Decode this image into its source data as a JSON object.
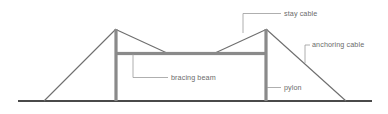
{
  "diagram": {
    "colors": {
      "ground": "#4a4a4a",
      "structure": "#8a8a8a",
      "cable": "#6e6e6e",
      "leader": "#9a9a9a",
      "label_text": "#6b6b6b",
      "background": "#ffffff"
    },
    "ground": {
      "name": "ground-line",
      "x1": 18,
      "y1": 101,
      "x2": 372,
      "y2": 101
    },
    "pylons": [
      {
        "name": "pylon-left",
        "x": 116,
        "top": 29,
        "bottom": 101,
        "width": 3.2
      },
      {
        "name": "pylon-right",
        "x": 266,
        "top": 29,
        "bottom": 101,
        "width": 3.2
      }
    ],
    "bracing_beam": {
      "name": "bracing-beam",
      "x1": 115,
      "x2": 267,
      "y": 53.5,
      "thickness": 3.2
    },
    "anchoring_cables": [
      {
        "name": "anchoring-cable-left",
        "x1": 44,
        "y1": 101,
        "x2": 116,
        "y2": 29
      },
      {
        "name": "anchoring-cable-right",
        "x1": 266,
        "y1": 29,
        "x2": 346,
        "y2": 101
      }
    ],
    "stay_cables": [
      {
        "name": "stay-cable-left",
        "x1": 117,
        "y1": 30,
        "x2": 167,
        "y2": 53
      },
      {
        "name": "stay-cable-right",
        "x1": 265,
        "y1": 30,
        "x2": 215,
        "y2": 53
      }
    ],
    "labels": [
      {
        "id": "stay-cable",
        "text": "stay cable",
        "text_x": 284,
        "text_y": 14,
        "leader": "M243,33 L243,13.5 L281,13.5"
      },
      {
        "id": "anchoring-cable",
        "text": "anchoring cable",
        "text_x": 312,
        "text_y": 45.5,
        "leader": "M305,63 L305,45 L310,45"
      },
      {
        "id": "bracing-beam",
        "text": "bracing beam",
        "text_x": 171,
        "text_y": 78,
        "leader": "M133,54 L133,77.5 L168,77.5"
      },
      {
        "id": "pylon",
        "text": "pylon",
        "text_x": 284,
        "text_y": 88,
        "leader": "M267,87.5 L281,87.5"
      }
    ]
  }
}
